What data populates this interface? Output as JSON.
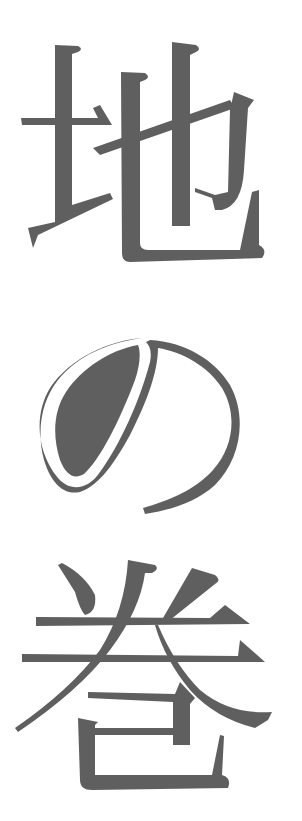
{
  "title": {
    "text": "地の巻",
    "characters": [
      {
        "char": "地",
        "name": "chi"
      },
      {
        "char": "の",
        "name": "no"
      },
      {
        "char": "巻",
        "name": "maki"
      }
    ],
    "orientation": "vertical",
    "ink_color": "#5f5f5f",
    "background_color": "#ffffff"
  }
}
